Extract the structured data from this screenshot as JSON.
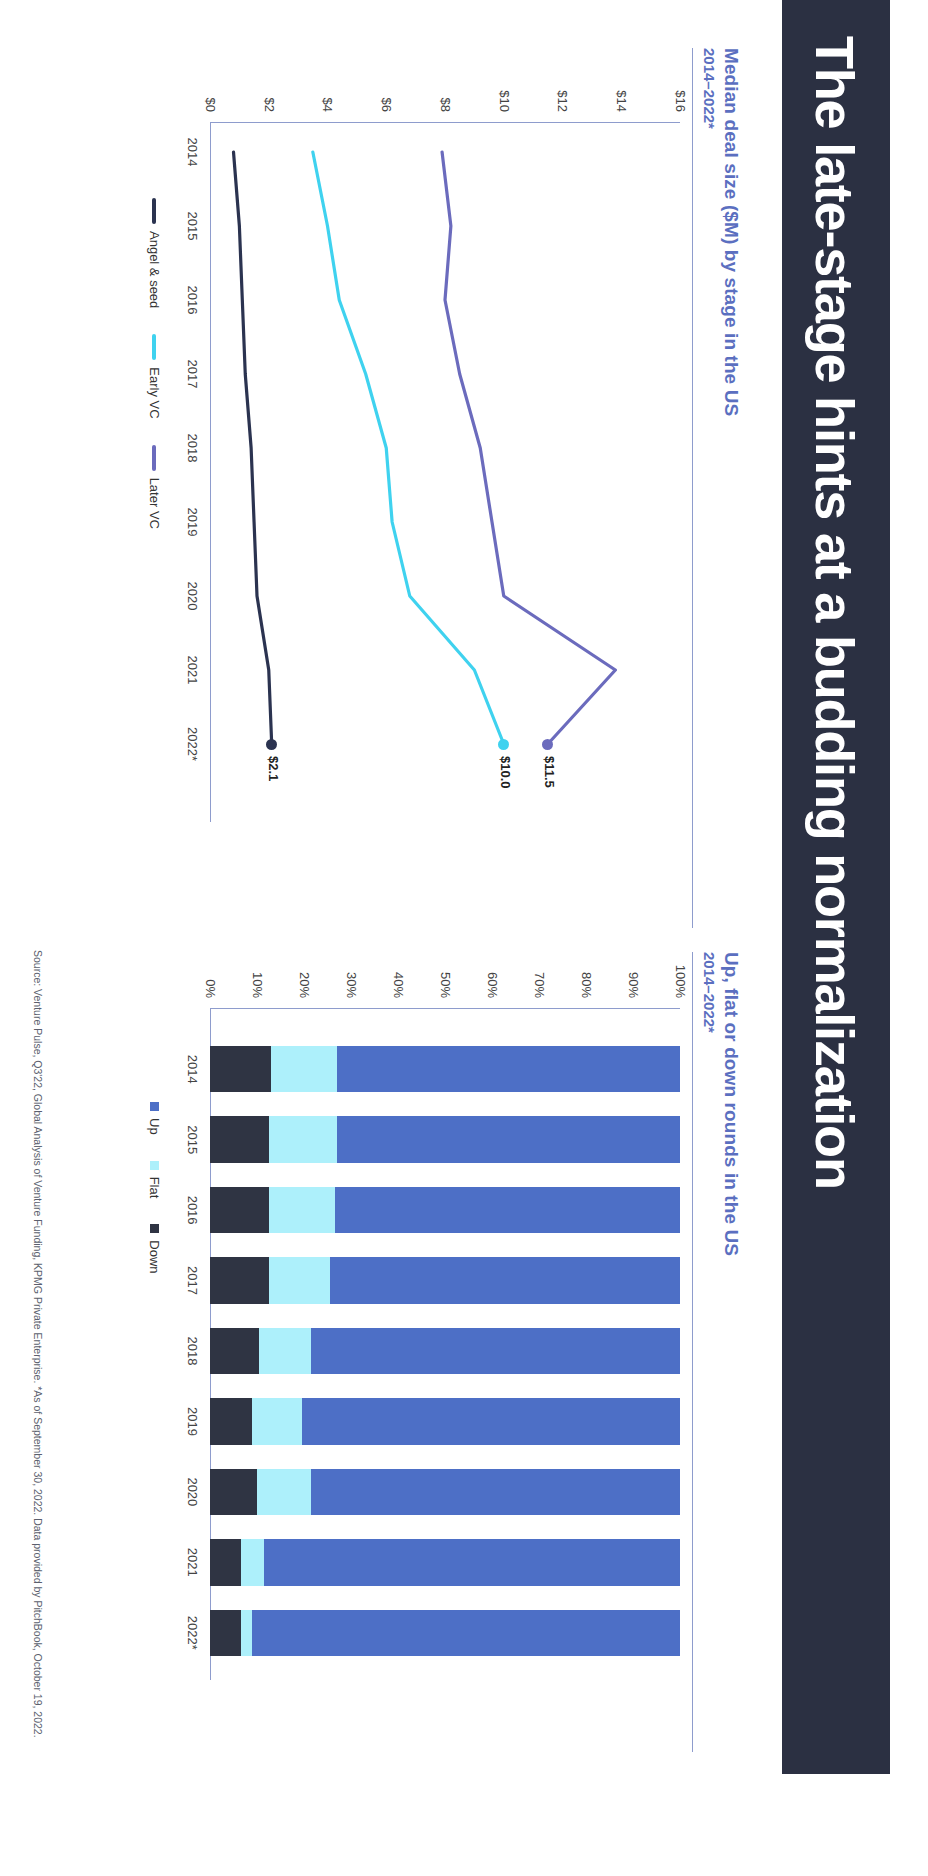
{
  "slide": {
    "title": "The late-stage hints at a budding normalization",
    "title_bold_prefix": "The late-stage",
    "title_rest": " hints at a budding normalization",
    "source": "Source: Venture Pulse, Q3'22, Global Analysis of Venture Funding, KPMG Private Enterprise. *As of September 30, 2022. Data provided by PitchBook, October 19, 2022.",
    "colors": {
      "band": "#2b3042",
      "heading": "#5b6fc0",
      "rule": "#8e9ccd",
      "angel_seed": "#2b3350",
      "early_vc": "#3fd2ef",
      "later_vc": "#6b6bbd",
      "up": "#4d6fc6",
      "flat": "#adf0fb",
      "down": "#2f3443"
    }
  },
  "left_panel": {
    "title": "Median deal size ($M) by stage in the US",
    "subtitle": "2014–2022*"
  },
  "right_panel": {
    "title": "Up, flat or down rounds in the US",
    "subtitle": "2014–2022*"
  },
  "chart_data": [
    {
      "type": "line",
      "title": "Median deal size ($M) by stage in the US",
      "subtitle": "2014–2022*",
      "xlabel": "",
      "ylabel": "",
      "x": [
        "2014",
        "2015",
        "2016",
        "2017",
        "2018",
        "2019",
        "2020",
        "2021",
        "2022*"
      ],
      "ylim": [
        0,
        16
      ],
      "yticks": [
        "$0",
        "$2",
        "$4",
        "$6",
        "$8",
        "$10",
        "$12",
        "$14",
        "$16"
      ],
      "ytick_values": [
        0,
        2,
        4,
        6,
        8,
        10,
        12,
        14,
        16
      ],
      "grid": false,
      "legend_position": "bottom",
      "series": [
        {
          "name": "Angel & seed",
          "color": "#2b3350",
          "values": [
            0.8,
            1.0,
            1.1,
            1.2,
            1.4,
            1.5,
            1.6,
            2.0,
            2.1
          ],
          "end_label": "$2.1"
        },
        {
          "name": "Early VC",
          "color": "#3fd2ef",
          "values": [
            3.5,
            4.0,
            4.4,
            5.3,
            6.0,
            6.2,
            6.8,
            9.0,
            10.0
          ],
          "end_label": "$10.0"
        },
        {
          "name": "Later VC",
          "color": "#6b6bbd",
          "values": [
            7.9,
            8.2,
            8.0,
            8.5,
            9.2,
            9.6,
            10.0,
            13.8,
            11.5
          ],
          "end_label": "$11.5"
        }
      ]
    },
    {
      "type": "bar",
      "subtype": "stacked-100",
      "title": "Up, flat or down rounds in the US",
      "subtitle": "2014–2022*",
      "categories": [
        "2014",
        "2015",
        "2016",
        "2017",
        "2018",
        "2019",
        "2020",
        "2021",
        "2022*"
      ],
      "ylim": [
        0,
        100
      ],
      "yticks": [
        "0%",
        "10%",
        "20%",
        "30%",
        "40%",
        "50%",
        "60%",
        "70%",
        "80%",
        "90%",
        "100%"
      ],
      "grid": false,
      "legend_position": "bottom",
      "series": [
        {
          "name": "Up",
          "color": "#4d6fc6",
          "values": [
            73.0,
            73.0,
            73.5,
            74.5,
            78.5,
            80.5,
            78.5,
            88.5,
            91.0
          ]
        },
        {
          "name": "Flat",
          "color": "#adf0fb",
          "values": [
            14.0,
            14.5,
            14.0,
            13.0,
            11.0,
            10.5,
            11.5,
            5.0,
            2.5
          ]
        },
        {
          "name": "Down",
          "color": "#2f3443",
          "values": [
            13.0,
            12.5,
            12.5,
            12.5,
            10.5,
            9.0,
            10.0,
            6.5,
            6.5
          ]
        }
      ]
    }
  ]
}
